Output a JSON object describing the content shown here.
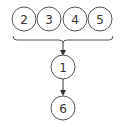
{
  "diagram": {
    "top_nodes": [
      {
        "label": "2"
      },
      {
        "label": "3"
      },
      {
        "label": "4"
      },
      {
        "label": "5"
      }
    ],
    "middle_node": {
      "label": "1"
    },
    "bottom_node": {
      "label": "6"
    },
    "colors": {
      "stroke": "#333333",
      "fill": "#ffffff"
    }
  }
}
